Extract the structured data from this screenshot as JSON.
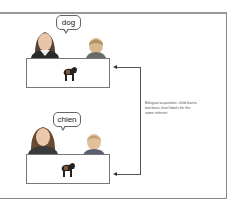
{
  "diagram": {
    "top_scene": {
      "speech": "dog",
      "speaker": "woman-adult",
      "listener": "child",
      "referent": "dog"
    },
    "bottom_scene": {
      "speech": "chien",
      "speaker": "woman-adult",
      "listener": "child",
      "referent": "dog"
    },
    "caption": "Bilingual acquisition: child learns two basic-level labels for the same referent",
    "colors": {
      "frame": "#9a9a9a",
      "line": "#555555",
      "text": "#555555"
    }
  }
}
